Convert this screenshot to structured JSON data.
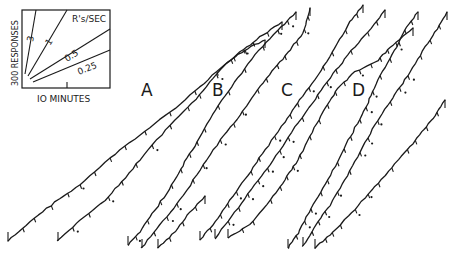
{
  "chart_data": {
    "type": "line",
    "title": "",
    "subtitle": "Cumulative response records",
    "panels": [
      "A",
      "B",
      "C",
      "D"
    ],
    "key": {
      "ylabel": "300 RESPONSES",
      "xlabel": "10 MINUTES",
      "rate_title": "R's/SEC",
      "rates": [
        "3",
        "1",
        "0.5",
        "0.25"
      ]
    },
    "xlabel": "10 MINUTES",
    "ylabel": "300 RESPONSES",
    "grid": false,
    "legend_position": "top-left inset",
    "series": [
      {
        "name": "A-1",
        "panel": "A",
        "points": [
          [
            8,
            241
          ],
          [
            30,
            222
          ],
          [
            55,
            202
          ],
          [
            80,
            185
          ],
          [
            110,
            158
          ],
          [
            140,
            135
          ],
          [
            170,
            112
          ],
          [
            200,
            87
          ],
          [
            225,
            64
          ],
          [
            245,
            50
          ],
          [
            265,
            40
          ]
        ]
      },
      {
        "name": "A-2",
        "panel": "A",
        "points": [
          [
            58,
            241
          ],
          [
            80,
            220
          ],
          [
            105,
            200
          ],
          [
            125,
            178
          ],
          [
            148,
            150
          ],
          [
            175,
            120
          ],
          [
            200,
            95
          ],
          [
            220,
            70
          ],
          [
            240,
            52
          ],
          [
            260,
            37
          ],
          [
            282,
            22
          ]
        ]
      },
      {
        "name": "B-1",
        "panel": "B",
        "points": [
          [
            128,
            245
          ],
          [
            140,
            232
          ],
          [
            155,
            210
          ],
          [
            172,
            185
          ],
          [
            185,
            162
          ],
          [
            200,
            138
          ],
          [
            215,
            110
          ],
          [
            235,
            82
          ],
          [
            255,
            55
          ],
          [
            278,
            30
          ],
          [
            296,
            12
          ]
        ]
      },
      {
        "name": "B-2",
        "panel": "B",
        "points": [
          [
            142,
            248
          ],
          [
            160,
            225
          ],
          [
            180,
            200
          ],
          [
            200,
            170
          ],
          [
            220,
            140
          ],
          [
            240,
            115
          ],
          [
            258,
            90
          ],
          [
            275,
            68
          ],
          [
            290,
            50
          ],
          [
            303,
            33
          ],
          [
            310,
            8
          ]
        ]
      },
      {
        "name": "B-3",
        "panel": "B",
        "points": [
          [
            158,
            248
          ],
          [
            175,
            232
          ],
          [
            190,
            212
          ],
          [
            205,
            196
          ]
        ]
      },
      {
        "name": "C-1",
        "panel": "C",
        "points": [
          [
            200,
            240
          ],
          [
            215,
            222
          ],
          [
            230,
            200
          ],
          [
            248,
            175
          ],
          [
            265,
            150
          ],
          [
            285,
            122
          ],
          [
            300,
            100
          ],
          [
            318,
            75
          ],
          [
            335,
            48
          ],
          [
            350,
            22
          ],
          [
            363,
            5
          ]
        ]
      },
      {
        "name": "C-2",
        "panel": "C",
        "points": [
          [
            215,
            238
          ],
          [
            235,
            212
          ],
          [
            255,
            185
          ],
          [
            273,
            160
          ],
          [
            292,
            132
          ],
          [
            312,
            103
          ],
          [
            330,
            78
          ],
          [
            348,
            55
          ],
          [
            368,
            32
          ],
          [
            385,
            10
          ]
        ]
      },
      {
        "name": "C-3",
        "panel": "C",
        "points": [
          [
            228,
            238
          ],
          [
            250,
            225
          ],
          [
            270,
            200
          ],
          [
            285,
            180
          ],
          [
            298,
            160
          ],
          [
            312,
            132
          ],
          [
            325,
            108
          ],
          [
            338,
            88
          ],
          [
            355,
            72
          ],
          [
            378,
            60
          ],
          [
            393,
            45
          ],
          [
            413,
            28
          ]
        ]
      },
      {
        "name": "D-1",
        "panel": "D",
        "points": [
          [
            288,
            248
          ],
          [
            300,
            230
          ],
          [
            313,
            205
          ],
          [
            328,
            180
          ],
          [
            342,
            153
          ],
          [
            355,
            128
          ],
          [
            368,
            103
          ],
          [
            378,
            80
          ],
          [
            392,
            55
          ],
          [
            405,
            30
          ],
          [
            418,
            12
          ]
        ]
      },
      {
        "name": "D-2",
        "panel": "D",
        "points": [
          [
            303,
            246
          ],
          [
            316,
            225
          ],
          [
            330,
            205
          ],
          [
            345,
            180
          ],
          [
            360,
            152
          ],
          [
            375,
            125
          ],
          [
            390,
            102
          ],
          [
            405,
            80
          ],
          [
            420,
            55
          ],
          [
            435,
            32
          ],
          [
            447,
            12
          ]
        ]
      },
      {
        "name": "D-3",
        "panel": "D",
        "points": [
          [
            315,
            248
          ],
          [
            330,
            235
          ],
          [
            345,
            220
          ],
          [
            365,
            198
          ],
          [
            385,
            175
          ],
          [
            405,
            152
          ],
          [
            420,
            135
          ],
          [
            433,
            118
          ],
          [
            445,
            100
          ]
        ]
      }
    ]
  },
  "labels": {
    "a": "A",
    "b": "B",
    "c": "C",
    "d": "D"
  },
  "key": {
    "ylabel": "300 RESPONSES",
    "xlabel": "IO MINUTES",
    "rate_title": "R's/SEC",
    "rate_3": "3",
    "rate_1": "1",
    "rate_05": "0.5",
    "rate_025": "0.25"
  }
}
